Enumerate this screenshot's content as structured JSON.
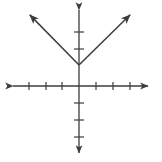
{
  "figure": {
    "name": "absolute-value-graph",
    "width": 162,
    "height": 162,
    "background_color": "#ffffff",
    "stroke_color": "#3c3c3c",
    "stroke_width": 1.5,
    "caption": ""
  },
  "chart_data": {
    "type": "line",
    "title": "",
    "xlabel": "",
    "ylabel": "",
    "grid": false,
    "legend": null,
    "axes": {
      "origin_px": [
        79,
        86
      ],
      "tick_spacing_px": 17,
      "x_axis": {
        "start_px": [
          11,
          86
        ],
        "end_px": [
          150,
          86
        ],
        "arrow_start": true,
        "arrow_end": true,
        "tick_positions_px": [
          29,
          46,
          62,
          96,
          113,
          130
        ],
        "tick_values": [
          -3,
          -2,
          -1,
          1,
          2,
          3
        ],
        "tick_half_length_px": 4,
        "tick_labels": []
      },
      "y_axis": {
        "start_px": [
          79,
          8
        ],
        "end_px": [
          79,
          155
        ],
        "arrow_start": true,
        "arrow_end": true,
        "tick_positions_px": [
          32,
          49,
          103,
          120,
          137
        ],
        "tick_values": [
          3,
          2,
          -1,
          -2,
          -3
        ],
        "tick_half_length_px": 5,
        "tick_labels": []
      },
      "xlim": [
        -4,
        4
      ],
      "ylim": [
        -4.5,
        4.5
      ]
    },
    "series": [
      {
        "name": "absolute-value-function",
        "shape": "v",
        "vertex_px": [
          79,
          65
        ],
        "vertex_value": [
          0,
          1.25
        ],
        "left_ray_end_px": [
          27,
          12
        ],
        "left_ray_end_value": [
          -3.06,
          4.35
        ],
        "right_ray_end_px": [
          133,
          12
        ],
        "right_ray_end_value": [
          3.18,
          4.35
        ],
        "arrow_left": true,
        "arrow_right": true,
        "slope_left": -1,
        "slope_right": 1,
        "x": [
          -3.06,
          0,
          3.18
        ],
        "y": [
          4.35,
          1.25,
          4.35
        ]
      }
    ]
  }
}
